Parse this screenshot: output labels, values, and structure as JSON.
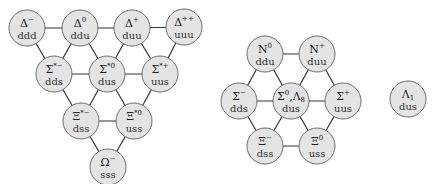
{
  "colors": {
    "node_fill": "#e4e4e4",
    "node_stroke": "#6e6e6e",
    "edge": "#333333"
  },
  "decuplet": {
    "nodes": [
      {
        "id": "delta-minus",
        "base": "Δ",
        "sup": "−",
        "sub": "",
        "quarks": "ddd",
        "x": 27,
        "y": 28
      },
      {
        "id": "delta-zero",
        "base": "Δ",
        "sup": "0",
        "sub": "",
        "quarks": "ddu",
        "x": 80,
        "y": 28
      },
      {
        "id": "delta-plus",
        "base": "Δ",
        "sup": "+",
        "sub": "",
        "quarks": "duu",
        "x": 132,
        "y": 28
      },
      {
        "id": "delta-plusplus",
        "base": "Δ",
        "sup": "++",
        "sub": "",
        "quarks": "uuu",
        "x": 184,
        "y": 27
      },
      {
        "id": "sigma-star-minus",
        "base": "Σ",
        "sup": "*−",
        "sub": "",
        "quarks": "dds",
        "x": 54,
        "y": 74
      },
      {
        "id": "sigma-star-zero",
        "base": "Σ",
        "sup": "*0",
        "sub": "",
        "quarks": "dus",
        "x": 107,
        "y": 74
      },
      {
        "id": "sigma-star-plus",
        "base": "Σ",
        "sup": "*+",
        "sub": "",
        "quarks": "uus",
        "x": 160,
        "y": 74
      },
      {
        "id": "xi-star-minus",
        "base": "Ξ",
        "sup": "*−",
        "sub": "",
        "quarks": "dss",
        "x": 81,
        "y": 121
      },
      {
        "id": "xi-star-zero",
        "base": "Ξ",
        "sup": "*0",
        "sub": "",
        "quarks": "uss",
        "x": 134,
        "y": 121
      },
      {
        "id": "omega-minus",
        "base": "Ω",
        "sup": "−",
        "sub": "",
        "quarks": "sss",
        "x": 108,
        "y": 167
      }
    ],
    "edges": [
      [
        0,
        1
      ],
      [
        1,
        2
      ],
      [
        2,
        3
      ],
      [
        0,
        4
      ],
      [
        4,
        1
      ],
      [
        1,
        5
      ],
      [
        5,
        2
      ],
      [
        2,
        6
      ],
      [
        6,
        3
      ],
      [
        4,
        5
      ],
      [
        5,
        6
      ],
      [
        4,
        7
      ],
      [
        7,
        5
      ],
      [
        5,
        8
      ],
      [
        8,
        6
      ],
      [
        7,
        8
      ],
      [
        7,
        9
      ],
      [
        9,
        8
      ]
    ]
  },
  "octet": {
    "nodes": [
      {
        "id": "n-zero",
        "base": "N",
        "sup": "0",
        "sub": "",
        "quarks": "ddu",
        "x": 265,
        "y": 54
      },
      {
        "id": "n-plus",
        "base": "N",
        "sup": "+",
        "sub": "",
        "quarks": "duu",
        "x": 317,
        "y": 54
      },
      {
        "id": "sigma-minus",
        "base": "Σ",
        "sup": "−",
        "sub": "",
        "quarks": "dds",
        "x": 239,
        "y": 101
      },
      {
        "id": "sigma-zero-lambda8",
        "base": "Σ",
        "sup": "0",
        "sub": "",
        "extra": ",Λ",
        "extra_sub": "8",
        "quarks": "dus",
        "x": 291,
        "y": 101
      },
      {
        "id": "sigma-plus",
        "base": "Σ",
        "sup": "+",
        "sub": "",
        "quarks": "uus",
        "x": 343,
        "y": 101
      },
      {
        "id": "xi-minus",
        "base": "Ξ",
        "sup": "−",
        "sub": "",
        "quarks": "dss",
        "x": 265,
        "y": 146
      },
      {
        "id": "xi-zero",
        "base": "Ξ",
        "sup": "0",
        "sub": "",
        "quarks": "uss",
        "x": 317,
        "y": 146
      }
    ],
    "edges": [
      [
        0,
        1
      ],
      [
        0,
        2
      ],
      [
        0,
        3
      ],
      [
        1,
        3
      ],
      [
        1,
        4
      ],
      [
        2,
        3
      ],
      [
        3,
        4
      ],
      [
        2,
        5
      ],
      [
        3,
        5
      ],
      [
        3,
        6
      ],
      [
        4,
        6
      ],
      [
        5,
        6
      ]
    ]
  },
  "singlet": {
    "nodes": [
      {
        "id": "lambda-one",
        "base": "Λ",
        "sup": "",
        "sub": "1",
        "quarks": "dus",
        "x": 408,
        "y": 99
      }
    ]
  },
  "radius": 18
}
